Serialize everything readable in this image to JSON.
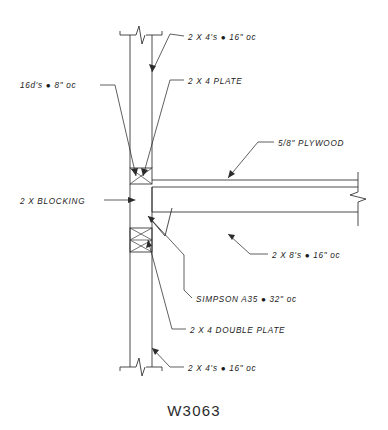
{
  "drawing": {
    "title": "W3063",
    "type": "architectural-construction-detail",
    "subject": "Wall to floor framing connection detail",
    "view": "section"
  },
  "annotations": [
    {
      "id": "top-studs",
      "name": "top-wall-studs",
      "text": "2 X 4's ● 16\" oc",
      "text_x": 188,
      "text_y": 40,
      "leader": "M 184 36 L 170 34 L 152 72",
      "arrow_x": 152,
      "arrow_y": 72,
      "arrow_angle": 115
    },
    {
      "id": "nails",
      "name": "nailing-spec",
      "text": "16d's ● 8\" oc",
      "text_x": 20,
      "text_y": 88,
      "leader": "M 100 85 L 115 85 L 136 176",
      "arrow_x": 136,
      "arrow_y": 176,
      "arrow_angle": 77
    },
    {
      "id": "plate",
      "name": "top-plate",
      "text": "2 X 4 PLATE",
      "text_x": 188,
      "text_y": 84,
      "leader": "M 184 80 L 170 80 L 143 176",
      "arrow_x": 143,
      "arrow_y": 176,
      "arrow_angle": 106
    },
    {
      "id": "plywood",
      "name": "plywood-sheathing",
      "text": "5/8\" PLYWOOD",
      "text_x": 278,
      "text_y": 146,
      "leader": "M 274 142 L 258 142 L 228 178",
      "arrow_x": 228,
      "arrow_y": 178,
      "arrow_angle": 130
    },
    {
      "id": "blocking",
      "name": "wall-blocking",
      "text": "2 X BLOCKING",
      "text_x": 20,
      "text_y": 204,
      "leader": "M 104 200 L 133 200",
      "arrow_x": 136,
      "arrow_y": 200,
      "arrow_angle": 0
    },
    {
      "id": "joists",
      "name": "floor-joists",
      "text": "2 X 8's ● 16\" oc",
      "text_x": 272,
      "text_y": 258,
      "leader": "M 268 254 L 250 254 L 228 234",
      "arrow_x": 228,
      "arrow_y": 234,
      "arrow_angle": 222
    },
    {
      "id": "simpson",
      "name": "simpson-a35-clip",
      "text": "SIMPSON A35 ● 32\" oc",
      "text_x": 196,
      "text_y": 302,
      "leader": "M 192 298 L 184 290 L 184 255 L 148 216",
      "arrow_x": 148,
      "arrow_y": 216,
      "arrow_angle": 227
    },
    {
      "id": "double-plate",
      "name": "double-top-plate",
      "text": "2 X 4 DOUBLE PLATE",
      "text_x": 190,
      "text_y": 333,
      "leader": "M 186 329 L 172 329 L 148 240",
      "arrow_x": 148,
      "arrow_y": 240,
      "arrow_angle": 255
    },
    {
      "id": "bottom-studs",
      "name": "lower-wall-studs",
      "text": "2 X 4's ● 16\" oc",
      "text_x": 188,
      "text_y": 371,
      "leader": "M 184 367 L 170 367 L 152 348",
      "arrow_x": 152,
      "arrow_y": 348,
      "arrow_angle": 224
    }
  ],
  "geometry": {
    "wall": {
      "left_x": 130,
      "right_x": 152,
      "top_y": 30,
      "bottom_y": 372
    },
    "floor": {
      "plywood_top_y": 180,
      "plywood_bottom_y": 187,
      "joist_bottom_y": 212,
      "right_x": 358
    },
    "blocking_upper": {
      "x": 130,
      "y": 168,
      "w": 22,
      "h": 16
    },
    "blocking_lower": {
      "x": 130,
      "y": 228,
      "w": 22,
      "h": 24
    }
  },
  "colors": {
    "line": "#2b2b2b",
    "text": "#1b1b1b",
    "background": "#ffffff",
    "title": "#2a2a2a"
  }
}
